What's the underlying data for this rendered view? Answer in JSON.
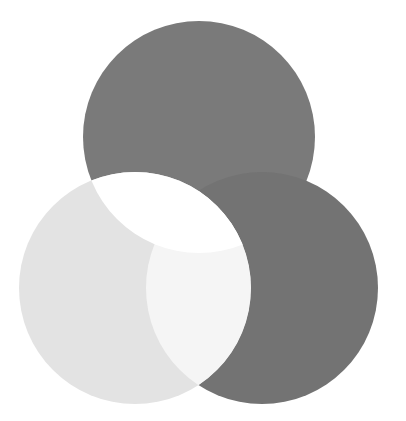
{
  "diagram": {
    "type": "venn",
    "sets": 3,
    "background": "#ffffff",
    "circles": [
      {
        "id": "top",
        "cx": 199,
        "cy": 137,
        "r": 116,
        "fill": "#7a7a7a"
      },
      {
        "id": "left",
        "cx": 135,
        "cy": 288,
        "r": 116,
        "fill": "#e3e3e3"
      },
      {
        "id": "right",
        "cx": 262,
        "cy": 288,
        "r": 116,
        "fill": "#737373"
      }
    ],
    "overlaps": {
      "top_left": "#ffffff",
      "left_right": "#f5f5f5",
      "top_right": "#737373",
      "all_three": "#ffffff"
    }
  }
}
